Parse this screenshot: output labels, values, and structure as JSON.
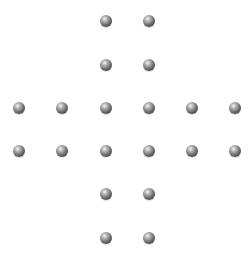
{
  "board": {
    "shape": "cross",
    "ball_color": "#5a5a5a",
    "background": "#ffffff",
    "balls": [
      {
        "x": 106,
        "y": 21
      },
      {
        "x": 149,
        "y": 21
      },
      {
        "x": 106,
        "y": 65
      },
      {
        "x": 149,
        "y": 65
      },
      {
        "x": 19,
        "y": 108
      },
      {
        "x": 62,
        "y": 108
      },
      {
        "x": 106,
        "y": 108
      },
      {
        "x": 149,
        "y": 108
      },
      {
        "x": 192,
        "y": 108
      },
      {
        "x": 235,
        "y": 108
      },
      {
        "x": 19,
        "y": 151
      },
      {
        "x": 62,
        "y": 151
      },
      {
        "x": 106,
        "y": 151
      },
      {
        "x": 149,
        "y": 151
      },
      {
        "x": 192,
        "y": 151
      },
      {
        "x": 235,
        "y": 151
      },
      {
        "x": 106,
        "y": 194
      },
      {
        "x": 149,
        "y": 194
      },
      {
        "x": 106,
        "y": 238
      },
      {
        "x": 149,
        "y": 238
      }
    ]
  }
}
